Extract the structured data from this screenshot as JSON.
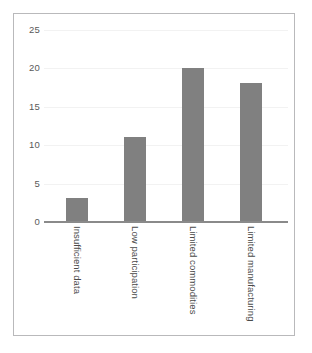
{
  "chart_data": {
    "type": "bar",
    "title": "",
    "subtitle": "",
    "xlabel": "",
    "ylabel": "",
    "categories": [
      "Insufficient data",
      "Low participation",
      "Limited commodities",
      "Limited manufacturing"
    ],
    "values": [
      3,
      11,
      20,
      18
    ],
    "ylim": [
      0,
      25
    ],
    "ytick_labels": [
      "0",
      "5",
      "10",
      "15",
      "20",
      "25"
    ],
    "ytick_values": [
      0,
      5,
      10,
      15,
      20,
      25
    ],
    "grid": true,
    "grid_axis": "y",
    "legend": false,
    "legend_position": "none",
    "annotations": [],
    "series": [
      {
        "name": "",
        "values": [
          3,
          11,
          20,
          18
        ]
      }
    ]
  },
  "style": {
    "bar_color": "#808080",
    "gridline_color": "#f2f2f2",
    "axis_line_color": "#8a8a8a",
    "frame_border_color": "#b9b9bb",
    "tick_label_color": "#595959",
    "category_label_color": "#4a4a4a",
    "background_color": "#ffffff"
  }
}
